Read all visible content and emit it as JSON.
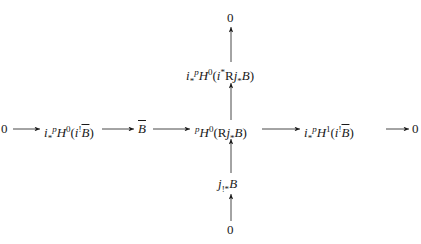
{
  "diagram": {
    "type": "commutative-diagram",
    "nodes": {
      "top_zero": "0",
      "top_object": {
        "prefix": "i",
        "sub": "*",
        "perv": "p",
        "H": "H",
        "deg": "0",
        "arg": "(i*Rj*B)"
      },
      "left_zero": "0",
      "left_object": {
        "prefix": "i",
        "sub": "*",
        "perv": "p",
        "H": "H",
        "deg": "0",
        "arg": "(i!B̄)"
      },
      "center_left": "B̄",
      "center": {
        "perv": "p",
        "H": "H",
        "deg": "0",
        "arg": "(Rj*B)"
      },
      "right_object": {
        "prefix": "i",
        "sub": "*",
        "perv": "p",
        "H": "H",
        "deg": "1",
        "arg": "(i!B̄)"
      },
      "right_zero": "0",
      "bottom_object": "j!*B",
      "bottom_zero": "0"
    },
    "labels": {
      "zero": "0",
      "i": "i",
      "star": "*",
      "p": "p",
      "H": "H",
      "deg0": "0",
      "deg1": "1",
      "R": "R",
      "j": "j",
      "B": "B",
      "shriek": "!",
      "shriek_star": "!*",
      "lparen": "(",
      "rparen": ")"
    },
    "arrows": [
      {
        "from": "left_zero",
        "to": "left_object"
      },
      {
        "from": "left_object",
        "to": "center_left"
      },
      {
        "from": "center_left",
        "to": "center"
      },
      {
        "from": "center",
        "to": "right_object"
      },
      {
        "from": "right_object",
        "to": "right_zero"
      },
      {
        "from": "bottom_zero",
        "to": "bottom_object"
      },
      {
        "from": "bottom_object",
        "to": "center"
      },
      {
        "from": "center",
        "to": "top_object"
      },
      {
        "from": "top_object",
        "to": "top_zero"
      }
    ]
  }
}
